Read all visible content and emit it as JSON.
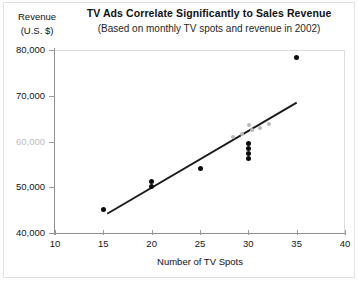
{
  "chart_data": {
    "type": "scatter",
    "title": "TV Ads Correlate Significantly to Sales Revenue",
    "subtitle": "(Based on monthly TV spots and revenue in 2002)",
    "xlabel": "Number of TV Spots",
    "ylabel_line1": "Revenue",
    "ylabel_line2": "(U.S. $)",
    "xlim": [
      10,
      40
    ],
    "ylim": [
      40000,
      80000
    ],
    "xticks": [
      10,
      15,
      20,
      25,
      30,
      35,
      40
    ],
    "xtick_labels": [
      "10",
      "15",
      "20",
      "25",
      "30",
      "35",
      "40"
    ],
    "yticks": [
      40000,
      50000,
      60000,
      70000,
      80000
    ],
    "ytick_labels": [
      "40,000",
      "50,000",
      "60,000",
      "70,000",
      "80,000"
    ],
    "ytick_faded": [
      60000
    ],
    "grid": false,
    "legend": null,
    "marker_color": "#0d0d0d",
    "pale_marker_color": "#b9b9b9",
    "trendline_color": "#1a1a1a",
    "points": [
      {
        "x": 15.0,
        "y": 45200,
        "shade": "dark"
      },
      {
        "x": 20.0,
        "y": 51300,
        "shade": "dark"
      },
      {
        "x": 20.0,
        "y": 50100,
        "shade": "dark"
      },
      {
        "x": 25.0,
        "y": 54000,
        "shade": "dark"
      },
      {
        "x": 30.0,
        "y": 59500,
        "shade": "dark"
      },
      {
        "x": 30.0,
        "y": 58400,
        "shade": "dark"
      },
      {
        "x": 30.0,
        "y": 57300,
        "shade": "dark"
      },
      {
        "x": 30.0,
        "y": 56300,
        "shade": "dark"
      },
      {
        "x": 35.0,
        "y": 78300,
        "shade": "dark"
      },
      {
        "x": 28.4,
        "y": 60900,
        "shade": "pale"
      },
      {
        "x": 29.3,
        "y": 61700,
        "shade": "pale"
      },
      {
        "x": 30.1,
        "y": 63700,
        "shade": "pale"
      },
      {
        "x": 30.4,
        "y": 62500,
        "shade": "pale"
      },
      {
        "x": 31.2,
        "y": 62900,
        "shade": "pale"
      },
      {
        "x": 32.1,
        "y": 63900,
        "shade": "pale"
      }
    ],
    "trendline": {
      "x_start": 15.4,
      "y_start": 44200,
      "x_end": 35.0,
      "y_end": 68500
    }
  },
  "icons": {
    "scatter_marker": "filled-circle",
    "trend": "linear-fit-line"
  }
}
